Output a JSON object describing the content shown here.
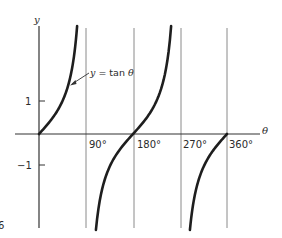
{
  "chart_data": {
    "type": "line",
    "title": "",
    "xlabel": "θ",
    "ylabel": "y",
    "curve_label": "y = tan θ",
    "x_ticks": [
      "90°",
      "180°",
      "270°",
      "360°"
    ],
    "x_tick_values": [
      90,
      180,
      270,
      360
    ],
    "y_ticks": [
      "1",
      "−1"
    ],
    "y_tick_values": [
      1,
      -1
    ],
    "xlim": [
      0,
      360
    ],
    "ylim": [
      -2.9,
      3.2
    ],
    "grid": "vertical lines at 90°, 180°, 270°, 360°",
    "series": [
      {
        "name": "y = tan θ",
        "segments": [
          {
            "x": [
              0,
              30,
              45,
              60,
              70,
              73
            ],
            "y": [
              0,
              0.577,
              1,
              1.732,
              2.747,
              3.27
            ]
          },
          {
            "x": [
              109,
              120,
              135,
              150,
              180,
              210,
              225,
              240,
              253
            ],
            "y": [
              -2.904,
              -1.732,
              -1,
              -0.577,
              0,
              0.577,
              1,
              1.732,
              3.27
            ]
          },
          {
            "x": [
              289,
              300,
              315,
              330,
              360
            ],
            "y": [
              -2.904,
              -1.732,
              -1,
              -0.577,
              0
            ]
          }
        ]
      }
    ]
  },
  "labels": {
    "y_axis": "y",
    "x_axis": "θ",
    "curve": "y = tan θ",
    "tick_90": "90°",
    "tick_180": "180°",
    "tick_270": "270°",
    "tick_360": "360°",
    "tick_pos1": "1",
    "tick_neg1": "−1",
    "corner_mark": "6"
  },
  "colors": {
    "curve": "#1e1e1e",
    "axis": "#333333",
    "grid": "#8a8a8a"
  }
}
